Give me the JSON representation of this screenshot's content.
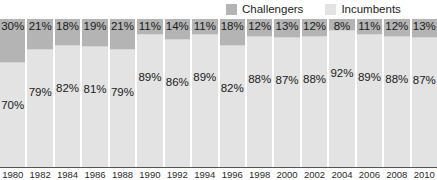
{
  "chart_data": {
    "type": "bar",
    "subtype": "stacked-100-percent",
    "title": "",
    "subtitle": "",
    "xlabel": "",
    "ylabel": "",
    "ylim": [
      0,
      100
    ],
    "grid": false,
    "legend_position": "top-right",
    "categories": [
      "1980",
      "1982",
      "1984",
      "1986",
      "1988",
      "1990",
      "1992",
      "1994",
      "1996",
      "1998",
      "2000",
      "2002",
      "2004",
      "2006",
      "2008",
      "2010"
    ],
    "series": [
      {
        "name": "Challengers",
        "color": "#b4b4b4",
        "values": [
          30,
          21,
          18,
          19,
          21,
          11,
          14,
          11,
          18,
          12,
          13,
          12,
          8,
          11,
          12,
          13
        ],
        "labels": [
          "30%",
          "21%",
          "18%",
          "19%",
          "21%",
          "11%",
          "14%",
          "11%",
          "18%",
          "12%",
          "13%",
          "12%",
          "8%",
          "11%",
          "12%",
          "13%"
        ]
      },
      {
        "name": "Incumbents",
        "color": "#e3e3e3",
        "values": [
          70,
          79,
          82,
          81,
          79,
          89,
          86,
          89,
          82,
          88,
          87,
          88,
          92,
          89,
          88,
          87
        ],
        "labels": [
          "70%",
          "79%",
          "82%",
          "81%",
          "79%",
          "89%",
          "86%",
          "89%",
          "82%",
          "88%",
          "87%",
          "88%",
          "92%",
          "89%",
          "88%",
          "87%"
        ]
      }
    ]
  },
  "legend": {
    "items": [
      {
        "label": "Challengers",
        "color": "#b4b4b4"
      },
      {
        "label": "Incumbents",
        "color": "#e3e3e3"
      }
    ]
  }
}
